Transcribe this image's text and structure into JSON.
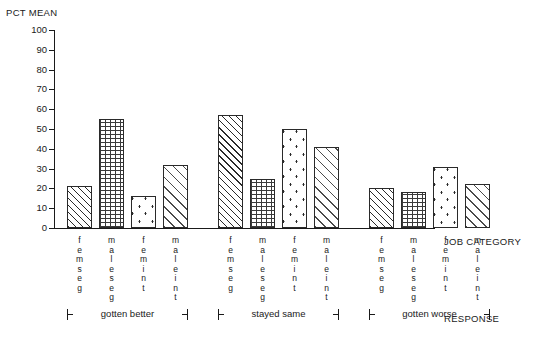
{
  "chart_data": {
    "type": "bar",
    "title": "",
    "ylabel": "PCT MEAN",
    "xlabel": "RESPONSE",
    "grid": false,
    "legend": "none",
    "ylim": [
      0,
      100
    ],
    "yticks": [
      0,
      10,
      20,
      30,
      40,
      50,
      60,
      70,
      80,
      90,
      100
    ],
    "group_axis_label": "JOB CATEGORY",
    "groups": [
      "gotten better",
      "stayed same",
      "gotten worse"
    ],
    "categories": [
      "femseg",
      "maleseg",
      "femint",
      "maleint"
    ],
    "series": [
      {
        "name": "gotten better",
        "values": [
          21,
          55,
          16,
          32
        ]
      },
      {
        "name": "stayed same",
        "values": [
          57,
          25,
          50,
          41
        ]
      },
      {
        "name": "gotten worse",
        "values": [
          20,
          18,
          31,
          22
        ]
      }
    ]
  },
  "labels": {
    "y_axis_title": "PCT MEAN",
    "job_category_title": "JOB CATEGORY",
    "response_title": "RESPONSE"
  },
  "y_ticks": [
    {
      "value": 100,
      "text": "100"
    },
    {
      "value": 90,
      "text": "90"
    },
    {
      "value": 80,
      "text": "80"
    },
    {
      "value": 70,
      "text": "70"
    },
    {
      "value": 60,
      "text": "60"
    },
    {
      "value": 50,
      "text": "50"
    },
    {
      "value": 40,
      "text": "40"
    },
    {
      "value": 30,
      "text": "30"
    },
    {
      "value": 20,
      "text": "20"
    },
    {
      "value": 10,
      "text": "10"
    },
    {
      "value": 0,
      "text": "0"
    }
  ],
  "bars": [
    {
      "group": "gotten better",
      "category": "femseg",
      "value": 21,
      "pattern": "femseg"
    },
    {
      "group": "gotten better",
      "category": "maleseg",
      "value": 55,
      "pattern": "maleseg"
    },
    {
      "group": "gotten better",
      "category": "femint",
      "value": 16,
      "pattern": "femint"
    },
    {
      "group": "gotten better",
      "category": "maleint",
      "value": 32,
      "pattern": "maleint"
    },
    {
      "group": "stayed same",
      "category": "femseg",
      "value": 57,
      "pattern": "femseg"
    },
    {
      "group": "stayed same",
      "category": "maleseg",
      "value": 25,
      "pattern": "maleseg"
    },
    {
      "group": "stayed same",
      "category": "femint",
      "value": 50,
      "pattern": "femint"
    },
    {
      "group": "stayed same",
      "category": "maleint",
      "value": 41,
      "pattern": "maleint"
    },
    {
      "group": "gotten worse",
      "category": "femseg",
      "value": 20,
      "pattern": "femseg"
    },
    {
      "group": "gotten worse",
      "category": "maleseg",
      "value": 18,
      "pattern": "maleseg"
    },
    {
      "group": "gotten worse",
      "category": "femint",
      "value": 31,
      "pattern": "femint"
    },
    {
      "group": "gotten worse",
      "category": "maleint",
      "value": 22,
      "pattern": "maleint"
    }
  ],
  "group_brackets": [
    {
      "label": "gotten better"
    },
    {
      "label": "stayed same"
    },
    {
      "label": "gotten worse"
    }
  ],
  "colors": {
    "ink": "#1a1a1a",
    "hatch": "#2a2a2a",
    "background": "#ffffff"
  }
}
